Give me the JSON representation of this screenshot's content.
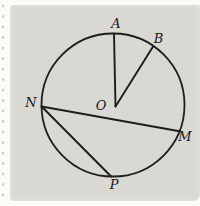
{
  "diagram": {
    "type": "circle-geometry",
    "center_point": "O",
    "points_on_circle": [
      "A",
      "B",
      "N",
      "M",
      "P"
    ],
    "segments": [
      "OA",
      "OB",
      "NM",
      "NP"
    ]
  },
  "labels": {
    "A": "A",
    "B": "B",
    "N": "N",
    "O": "O",
    "M": "M",
    "P": "P"
  },
  "colors": {
    "panel_bg": "#d9d8d3",
    "page_bg": "#fbfbf8",
    "line": "#1d1d1b",
    "label_text": "#161614",
    "perforation_dot": "#c6c6c4"
  }
}
